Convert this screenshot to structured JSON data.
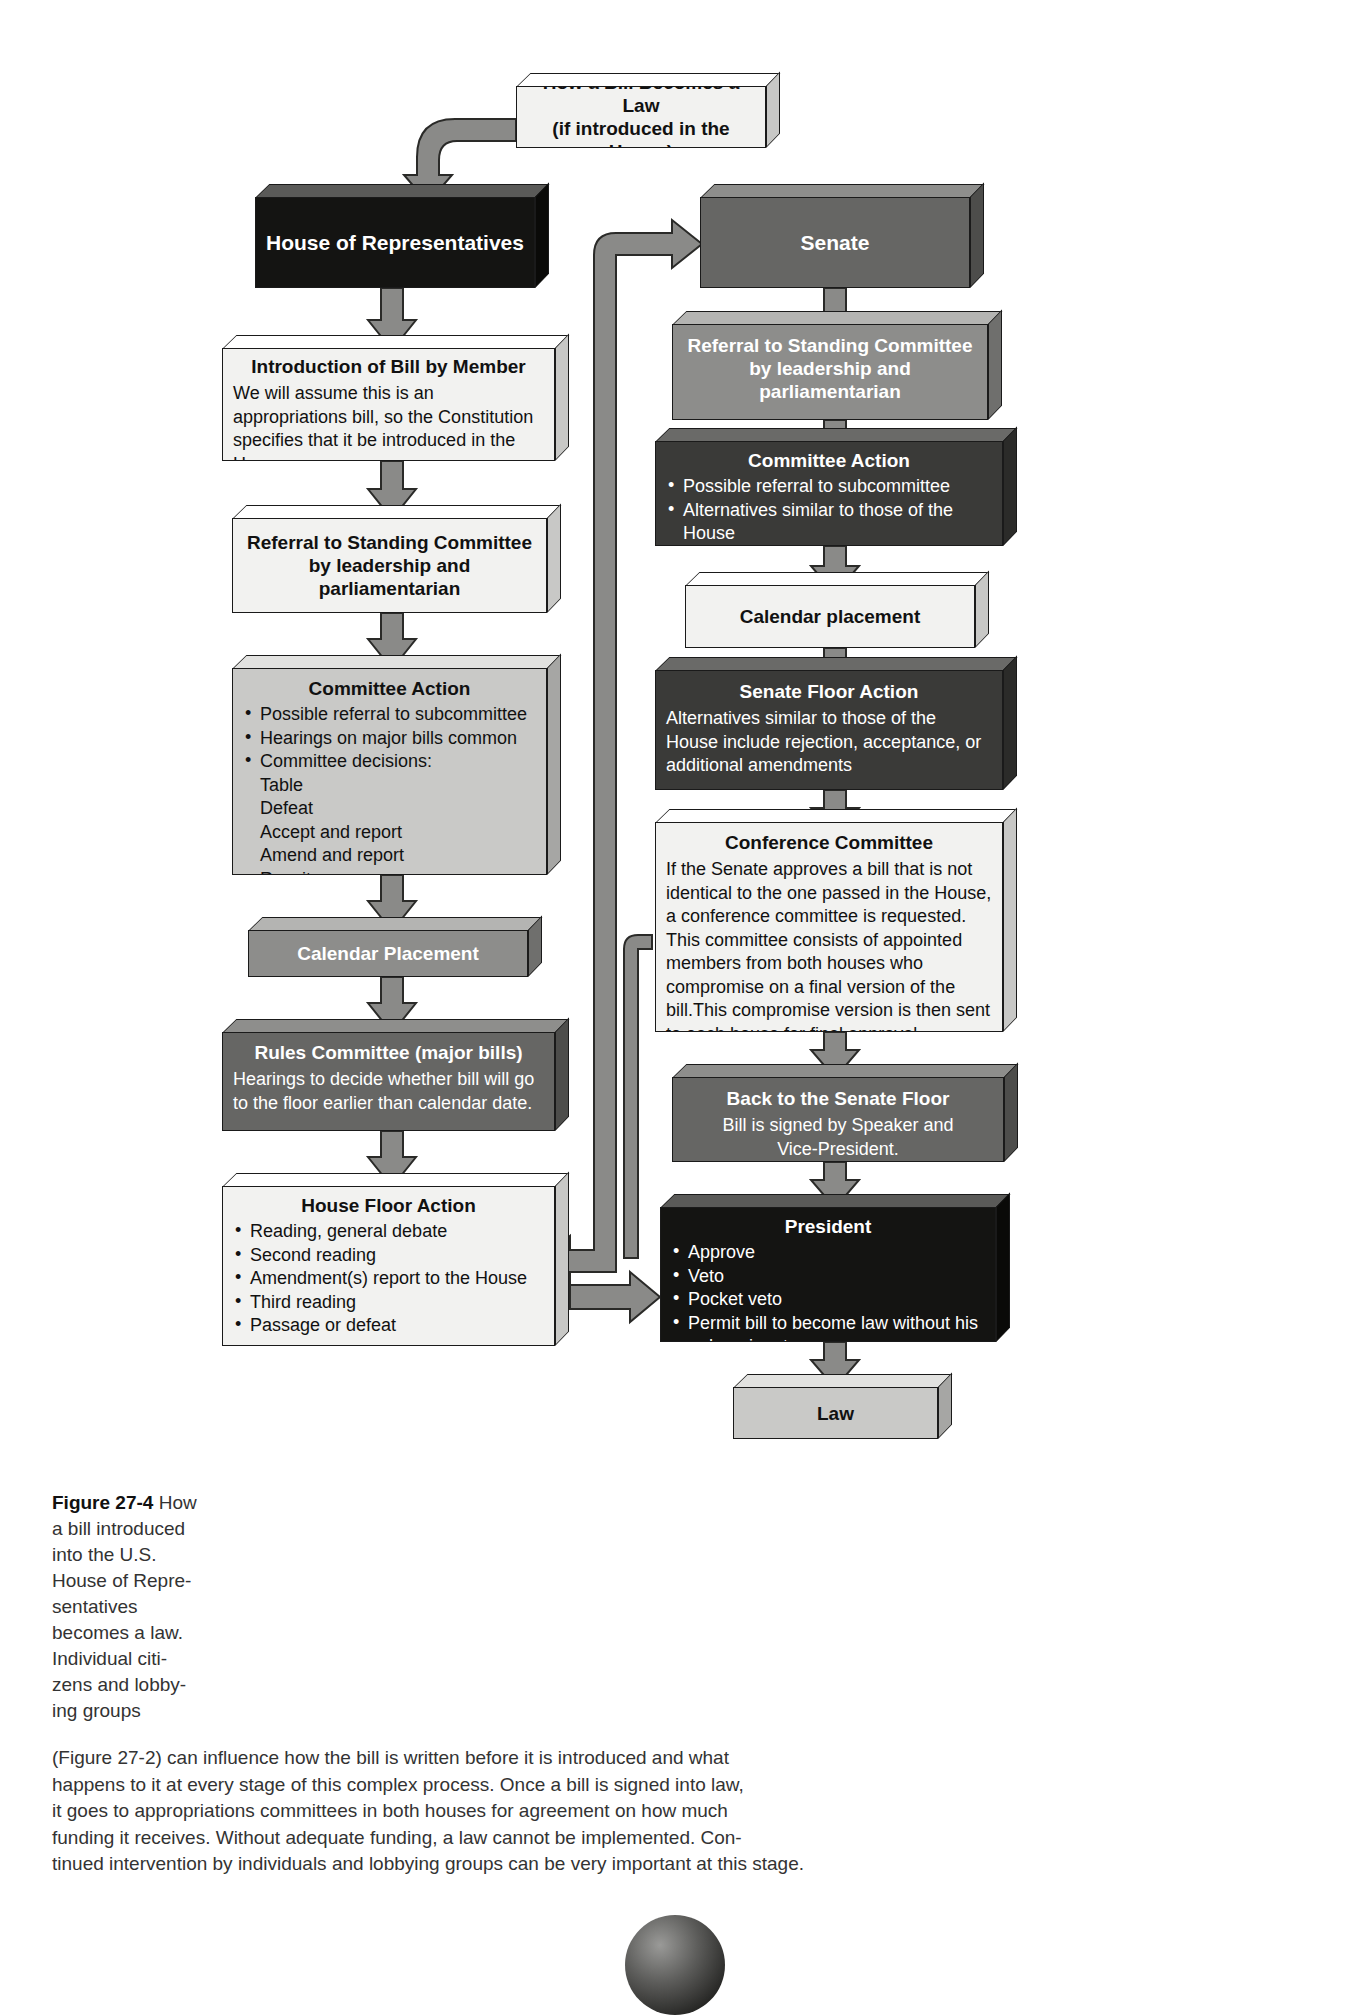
{
  "figure": {
    "title_line1": "How a Bill Becomes a Law",
    "title_line2": "(if introduced in the House)",
    "caption_label": "Figure 27-4",
    "caption_side": "How a bill introduced into the U.S. House of Repre-sentatives becomes a law. Individual citi-zens and lobby-ing groups",
    "caption_side_lines": [
      "How",
      "a bill introduced",
      "into the U.S.",
      "House of Repre-",
      "sentatives",
      "becomes a law.",
      "Individual citi-",
      "zens and lobby-",
      "ing groups"
    ],
    "caption_body_lines": [
      "(Figure 27-2) can influence how the bill is written before it is introduced and what",
      "happens to it at every stage of this complex process. Once a bill is signed into law,",
      "it goes to appropriations committees in both houses for agreement on how much",
      "funding it receives. Without adequate funding, a law cannot be implemented. Con-",
      "tinued intervention by individuals and lobbying groups can be very important at this stage."
    ]
  },
  "house": {
    "header": "House of Representatives",
    "introduction": {
      "title": "Introduction of Bill by Member",
      "body": "We will assume this is an appropriations bill, so the Constitution specifies that it be introduced in the House."
    },
    "referral": {
      "title_line1": "Referral to Standing Committee",
      "title_line2": "by leadership and",
      "title_line3": "parliamentarian"
    },
    "committee_action": {
      "title": "Committee Action",
      "bullets": [
        "Possible referral to subcommittee",
        "Hearings on major bills common",
        "Committee decisions:"
      ],
      "decisions": [
        "Table",
        "Defeat",
        "Accept and report",
        "Amend and report",
        "Rewrite"
      ]
    },
    "calendar": {
      "title": "Calendar Placement"
    },
    "rules": {
      "title": "Rules Committee (major bills)",
      "body": "Hearings to decide whether bill will go to the floor earlier than calendar date."
    },
    "floor_action": {
      "title": "House Floor Action",
      "bullets": [
        "Reading, general debate",
        "Second reading",
        "Amendment(s) report to the House",
        "Third reading",
        "Passage or defeat"
      ]
    }
  },
  "senate": {
    "header": "Senate",
    "referral": {
      "title_line1": "Referral to Standing Committee",
      "title_line2": "by leadership and",
      "title_line3": "parliamentarian"
    },
    "committee_action": {
      "title": "Committee Action",
      "bullets": [
        "Possible referral to subcommittee",
        "Alternatives similar to those of the House"
      ]
    },
    "calendar": {
      "title": "Calendar placement"
    },
    "floor_action": {
      "title": "Senate Floor Action",
      "body": "Alternatives similar to those of the House include rejection, acceptance, or additional amendments"
    },
    "conference": {
      "title": "Conference Committee",
      "body": "If the Senate approves a bill that is not identical to the one passed in the House, a conference committee is requested. This committee consists of appointed members from both houses who compromise on a final version of the bill.This compromise version is then sent to each house for final approval."
    },
    "back_to_floor": {
      "title": "Back to the Senate Floor",
      "body_line1": "Bill is signed by Speaker and",
      "body_line2": "Vice-President."
    }
  },
  "president": {
    "title": "President",
    "bullets": [
      "Approve",
      "Veto",
      "Pocket veto",
      "Permit bill to become law without his or her signature"
    ]
  },
  "law": {
    "title": "Law"
  },
  "colors": {
    "white_box": "#f2f2f0",
    "light_gray": "#c9c9c7",
    "mid_gray": "#8d8d8b",
    "dark_gray": "#666664",
    "very_dark_gray": "#3a3a38",
    "black_box": "#141412",
    "arrow_fill": "#8a8a88",
    "arrow_stroke": "#2a2a28"
  }
}
